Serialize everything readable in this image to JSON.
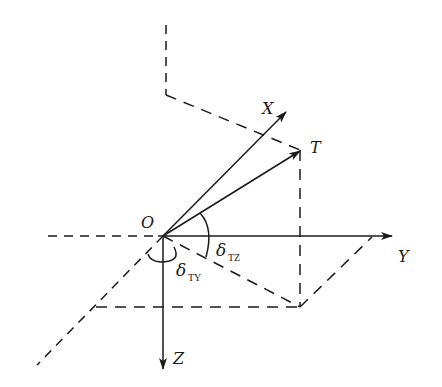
{
  "diagram": {
    "title": "",
    "labels": {
      "origin": "O",
      "x_axis": "X",
      "y_axis": "Y",
      "z_axis": "Z",
      "target": "T",
      "angle_tz_symbol": "δ",
      "angle_tz_sub": "TZ",
      "angle_ty_symbol": "δ",
      "angle_ty_sub": "TY"
    },
    "colors": {
      "line": "#1a1a1a",
      "background": "#ffffff"
    }
  }
}
